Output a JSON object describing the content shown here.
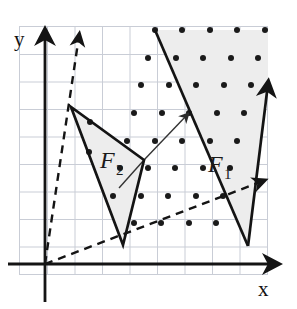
{
  "figure": {
    "width": 297,
    "height": 309,
    "background_color": "#ffffff",
    "grid": {
      "color": "#c9cdd6",
      "spacing_px": 27.5,
      "x_lines": [
        20,
        47.5,
        75,
        102.5,
        130,
        157.5,
        185,
        212.5,
        240,
        267.5
      ],
      "y_lines": [
        27,
        54.5,
        82,
        109.5,
        137,
        164.5,
        192,
        219.5,
        247,
        274.5
      ],
      "visible": true,
      "frame_color": "#c9cdd6"
    },
    "axes": {
      "color": "#141414",
      "origin": {
        "x": 45,
        "y": 264
      },
      "x_axis": {
        "label": "x",
        "label_x": 262,
        "label_y": 295,
        "start_x": 8,
        "end_x": 282,
        "y": 264
      },
      "y_axis": {
        "label": "y",
        "label_x": 14,
        "label_y": 40,
        "x": 45,
        "start_y": 300,
        "end_y": 26
      }
    },
    "lattice": {
      "dot_color": "#1a1a1a",
      "dot_radius": 2.9,
      "origin_x": 48,
      "origin_y": 259,
      "step_x": 27.5,
      "step_y": 27.5,
      "points": [
        [
          155,
          30
        ],
        [
          182,
          30
        ],
        [
          210,
          30
        ],
        [
          237,
          30
        ],
        [
          265,
          30
        ],
        [
          148,
          57
        ],
        [
          176,
          57
        ],
        [
          203,
          57
        ],
        [
          231,
          57
        ],
        [
          258,
          57
        ],
        [
          141,
          85
        ],
        [
          169,
          85
        ],
        [
          196,
          85
        ],
        [
          224,
          85
        ],
        [
          251,
          85
        ],
        [
          268,
          80
        ],
        [
          90,
          121
        ],
        [
          120,
          112
        ],
        [
          134,
          112
        ],
        [
          161,
          112
        ],
        [
          189,
          112
        ],
        [
          217,
          112
        ],
        [
          244,
          112
        ],
        [
          88,
          152
        ],
        [
          127,
          140
        ],
        [
          154,
          140
        ],
        [
          182,
          140
        ],
        [
          210,
          140
        ],
        [
          237,
          140
        ],
        [
          120,
          167
        ],
        [
          147,
          167
        ],
        [
          175,
          167
        ],
        [
          203,
          167
        ],
        [
          230,
          167
        ],
        [
          113,
          195
        ],
        [
          140,
          195
        ],
        [
          168,
          195
        ],
        [
          196,
          195
        ],
        [
          223,
          195
        ],
        [
          106,
          222
        ],
        [
          134,
          222
        ],
        [
          161,
          222
        ],
        [
          189,
          222
        ],
        [
          216,
          222
        ]
      ]
    },
    "regions": [
      {
        "id": "F1",
        "label": "F",
        "subscript": "1",
        "label_x": 213,
        "label_y": 168,
        "fill": "#eeeeee",
        "stroke": "#141414",
        "stroke_width": 2.6,
        "vertices": "155,30 248,246 268,80",
        "apex": {
          "x": 248,
          "y": 246
        },
        "arrow_tip": {
          "x": 268,
          "y": 80
        }
      },
      {
        "id": "F2",
        "label": "F",
        "subscript": "2",
        "label_x": 103,
        "label_y": 163,
        "fill": "#eeeeee",
        "stroke": "#141414",
        "stroke_width": 2.6,
        "vertices": "71,107 123,245 144,160",
        "apex": {
          "x": 123,
          "y": 245
        }
      }
    ],
    "dashed_lines": {
      "color": "#141414",
      "stroke_width": 2.4,
      "dash_pattern": "8 6",
      "rays": [
        {
          "name": "upper-dashed-ray",
          "x1": 45,
          "y1": 264,
          "x2": 79,
          "y2": 33,
          "arrow_tip": {
            "x": 79,
            "y": 33
          }
        },
        {
          "name": "lower-dashed-ray",
          "x1": 45,
          "y1": 264,
          "x2": 268,
          "y2": 180,
          "arrow_tip": {
            "x": 268,
            "y": 180
          }
        }
      ]
    },
    "thin_lines": {
      "color": "#3a3a3a",
      "stroke_width": 1.3,
      "segments": [
        {
          "name": "cone-ray-up-right",
          "x1": 144,
          "y1": 160,
          "x2": 190,
          "y2": 112
        },
        {
          "name": "cone-ray-down-left",
          "x1": 144,
          "y1": 160,
          "x2": 120,
          "y2": 187
        }
      ],
      "arrow_tip": {
        "x": 190,
        "y": 112
      }
    }
  }
}
